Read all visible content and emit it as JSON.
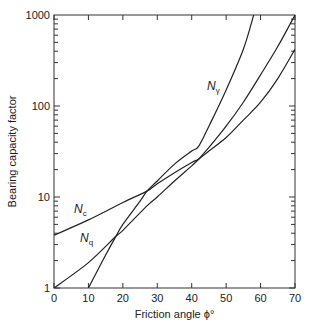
{
  "chart_data": {
    "type": "line",
    "title": "",
    "xlabel": "Friction angle ϕ°",
    "ylabel": "Bearing capacity factor",
    "xlim": [
      0,
      70
    ],
    "ylim": [
      1,
      1000
    ],
    "yscale": "log",
    "grid": false,
    "x_ticks": [
      "0",
      "10",
      "20",
      "30",
      "40",
      "50",
      "60",
      "70"
    ],
    "y_ticks": [
      "1",
      "10",
      "100",
      "1000"
    ],
    "series": [
      {
        "name": "Nc",
        "label_main": "N",
        "label_sub": "c",
        "x": [
          0,
          10,
          20,
          27,
          30,
          35,
          40,
          42,
          45,
          50,
          55,
          60,
          65,
          70
        ],
        "values": [
          3.8,
          5.6,
          8.7,
          11.6,
          14,
          18.5,
          24,
          26,
          32,
          45,
          70,
          110,
          200,
          420
        ]
      },
      {
        "name": "Nq",
        "label_main": "N",
        "label_sub": "q",
        "x": [
          0,
          10,
          18,
          20,
          27,
          30,
          35,
          40,
          42,
          45,
          50,
          55,
          60,
          65,
          70
        ],
        "values": [
          1,
          1.9,
          3.7,
          4.3,
          8,
          10,
          15,
          22,
          26,
          35,
          60,
          110,
          220,
          450,
          1000
        ]
      },
      {
        "name": "Nγ",
        "label_main": "N",
        "label_sub": "γ",
        "x": [
          10,
          15,
          18,
          20,
          25,
          27,
          30,
          35,
          40,
          42,
          45,
          50,
          55,
          58
        ],
        "values": [
          1,
          2.3,
          3.7,
          5,
          9,
          11.6,
          15,
          23,
          32,
          36,
          60,
          150,
          420,
          1000
        ]
      }
    ]
  }
}
